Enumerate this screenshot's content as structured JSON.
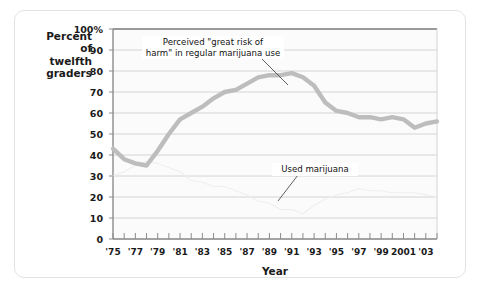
{
  "chart_data": {
    "type": "line",
    "title": "",
    "xlabel": "Year",
    "ylabel": "Percent of twelfth graders",
    "ylabel_lines": [
      "Percent",
      "of",
      "twelfth",
      "graders"
    ],
    "ylim": [
      0,
      100
    ],
    "ytick_values": [
      0,
      10,
      20,
      30,
      40,
      50,
      60,
      70,
      80,
      90,
      100
    ],
    "ytick_labels": [
      "0",
      "10",
      "20",
      "30",
      "40",
      "50",
      "60",
      "70",
      "80",
      "90",
      "100%"
    ],
    "xlim": [
      1975,
      2004
    ],
    "xtick_values": [
      1975,
      1976,
      1977,
      1978,
      1979,
      1980,
      1981,
      1982,
      1983,
      1984,
      1985,
      1986,
      1987,
      1988,
      1989,
      1990,
      1991,
      1992,
      1993,
      1994,
      1995,
      1996,
      1997,
      1998,
      1999,
      2000,
      2001,
      2002,
      2003,
      2004
    ],
    "xtick_labeled_values": [
      1975,
      1977,
      1979,
      1981,
      1983,
      1985,
      1987,
      1989,
      1991,
      1993,
      1995,
      1997,
      1999,
      2001,
      2003
    ],
    "xtick_labels": [
      "'75",
      "'77",
      "'79",
      "'81",
      "'83",
      "'85",
      "'87",
      "'89",
      "'91",
      "'93",
      "'95",
      "'97",
      "'99",
      "2001",
      "'03"
    ],
    "grid": true,
    "grid_axis": "y",
    "legend": "annotations-inline",
    "series": [
      {
        "name": "Perceived \"great risk of harm\" in regular marijuana use",
        "color": "#bdbdbd",
        "x": [
          1975,
          1976,
          1977,
          1978,
          1979,
          1980,
          1981,
          1982,
          1983,
          1984,
          1985,
          1986,
          1987,
          1988,
          1989,
          1990,
          1991,
          1992,
          1993,
          1994,
          1995,
          1996,
          1997,
          1998,
          1999,
          2000,
          2001,
          2002,
          2003,
          2004
        ],
        "values": [
          43,
          38,
          36,
          35,
          42,
          50,
          57,
          60,
          63,
          67,
          70,
          71,
          74,
          77,
          78,
          78,
          79,
          77,
          73,
          65,
          61,
          60,
          58,
          58,
          57,
          58,
          57,
          53,
          55,
          56
        ]
      },
      {
        "name": "Used marijuana",
        "color": "#ededed",
        "x": [
          1975,
          1976,
          1977,
          1978,
          1979,
          1980,
          1981,
          1982,
          1983,
          1984,
          1985,
          1986,
          1987,
          1988,
          1989,
          1990,
          1991,
          1992,
          1993,
          1994,
          1995,
          1996,
          1997,
          1998,
          1999,
          2000,
          2001,
          2002,
          2003,
          2004
        ],
        "values": [
          30,
          32,
          35,
          37,
          36,
          34,
          32,
          28,
          27,
          25,
          25,
          23,
          21,
          18,
          17,
          14,
          14,
          12,
          16,
          19,
          21,
          22,
          24,
          23,
          23,
          22,
          22,
          22,
          21,
          20
        ]
      }
    ],
    "annotations": [
      {
        "id": "risk",
        "text": "Perceived \"great risk of\nharm\" in regular marijuana use"
      },
      {
        "id": "used",
        "text": "Used marijuana"
      }
    ]
  }
}
